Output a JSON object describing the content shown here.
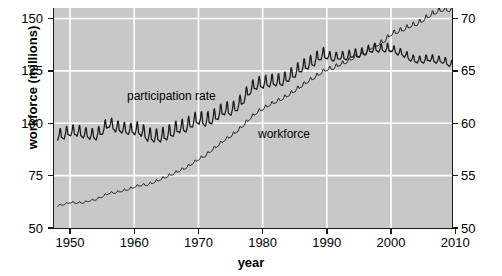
{
  "chart_data": {
    "type": "line",
    "title": "",
    "subtitle": "",
    "xlabel": "year",
    "ylabel": "workforce (millions)",
    "ylabel_right": "participation rate (percent)",
    "xlim": [
      1947.5,
      2009.5
    ],
    "ylim": [
      50,
      155
    ],
    "ylim_right": [
      50,
      71
    ],
    "grid": true,
    "legend_position": "in-plot annotations",
    "xticks": [
      1950,
      1960,
      1970,
      1980,
      1990,
      2000,
      2010
    ],
    "xticklabels": [
      "1950",
      "1960",
      "1970",
      "1980",
      "1990",
      "2000",
      "2010"
    ],
    "yticks": [
      50,
      75,
      100,
      125,
      150
    ],
    "yticklabels": [
      "50",
      "75",
      "100",
      "125",
      "150"
    ],
    "yticks_right": [
      50,
      55,
      60,
      65,
      70
    ],
    "yticklabels_right": [
      "50",
      "55",
      "60",
      "65",
      "70"
    ],
    "annotations": [
      {
        "text": "participation rate",
        "x": 1963.5,
        "y": 113
      },
      {
        "text": "workforce",
        "x": 1984.0,
        "y": 92
      }
    ],
    "series": [
      {
        "name": "workforce",
        "axis": "left",
        "units": "millions",
        "seasonal": true,
        "description": "Monthly civilian labor force, seasonally unadjusted; small sawtooth seasonal cycle peaking each summer, rising steadily throughout.",
        "annual": [
          {
            "year": 1948,
            "value": 60.6
          },
          {
            "year": 1949,
            "value": 61.3
          },
          {
            "year": 1950,
            "value": 62.2
          },
          {
            "year": 1951,
            "value": 62.0
          },
          {
            "year": 1952,
            "value": 62.1
          },
          {
            "year": 1953,
            "value": 63.0
          },
          {
            "year": 1954,
            "value": 63.6
          },
          {
            "year": 1955,
            "value": 65.0
          },
          {
            "year": 1956,
            "value": 66.6
          },
          {
            "year": 1957,
            "value": 66.9
          },
          {
            "year": 1958,
            "value": 67.6
          },
          {
            "year": 1959,
            "value": 68.4
          },
          {
            "year": 1960,
            "value": 69.6
          },
          {
            "year": 1961,
            "value": 70.5
          },
          {
            "year": 1962,
            "value": 70.6
          },
          {
            "year": 1963,
            "value": 71.8
          },
          {
            "year": 1964,
            "value": 73.1
          },
          {
            "year": 1965,
            "value": 74.5
          },
          {
            "year": 1966,
            "value": 75.8
          },
          {
            "year": 1967,
            "value": 77.3
          },
          {
            "year": 1968,
            "value": 78.7
          },
          {
            "year": 1969,
            "value": 80.7
          },
          {
            "year": 1970,
            "value": 82.8
          },
          {
            "year": 1971,
            "value": 84.4
          },
          {
            "year": 1972,
            "value": 87.0
          },
          {
            "year": 1973,
            "value": 89.4
          },
          {
            "year": 1974,
            "value": 91.9
          },
          {
            "year": 1975,
            "value": 93.8
          },
          {
            "year": 1976,
            "value": 96.2
          },
          {
            "year": 1977,
            "value": 99.0
          },
          {
            "year": 1978,
            "value": 102.3
          },
          {
            "year": 1979,
            "value": 105.0
          },
          {
            "year": 1980,
            "value": 106.9
          },
          {
            "year": 1981,
            "value": 108.7
          },
          {
            "year": 1982,
            "value": 110.2
          },
          {
            "year": 1983,
            "value": 111.6
          },
          {
            "year": 1984,
            "value": 113.5
          },
          {
            "year": 1985,
            "value": 115.5
          },
          {
            "year": 1986,
            "value": 117.8
          },
          {
            "year": 1987,
            "value": 119.9
          },
          {
            "year": 1988,
            "value": 121.7
          },
          {
            "year": 1989,
            "value": 123.9
          },
          {
            "year": 1990,
            "value": 125.8
          },
          {
            "year": 1991,
            "value": 126.3
          },
          {
            "year": 1992,
            "value": 128.1
          },
          {
            "year": 1993,
            "value": 129.2
          },
          {
            "year": 1994,
            "value": 131.1
          },
          {
            "year": 1995,
            "value": 132.3
          },
          {
            "year": 1996,
            "value": 133.9
          },
          {
            "year": 1997,
            "value": 136.3
          },
          {
            "year": 1998,
            "value": 137.7
          },
          {
            "year": 1999,
            "value": 139.4
          },
          {
            "year": 2000,
            "value": 142.6
          },
          {
            "year": 2001,
            "value": 143.7
          },
          {
            "year": 2002,
            "value": 144.9
          },
          {
            "year": 2003,
            "value": 146.5
          },
          {
            "year": 2004,
            "value": 147.4
          },
          {
            "year": 2005,
            "value": 149.3
          },
          {
            "year": 2006,
            "value": 151.4
          },
          {
            "year": 2007,
            "value": 153.1
          },
          {
            "year": 2008,
            "value": 154.3
          },
          {
            "year": 2009,
            "value": 154.1
          }
        ]
      },
      {
        "name": "participation rate",
        "axis": "right",
        "units": "percent",
        "seasonal": true,
        "description": "Monthly labor force participation rate, seasonally unadjusted; large sawtooth seasonal swing peaking each summer, rising until about 2000 then declining.",
        "annual": [
          {
            "year": 1948,
            "value": 58.8
          },
          {
            "year": 1949,
            "value": 58.9
          },
          {
            "year": 1950,
            "value": 59.2
          },
          {
            "year": 1951,
            "value": 59.2
          },
          {
            "year": 1952,
            "value": 59.0
          },
          {
            "year": 1953,
            "value": 58.9
          },
          {
            "year": 1954,
            "value": 58.8
          },
          {
            "year": 1955,
            "value": 59.3
          },
          {
            "year": 1956,
            "value": 60.0
          },
          {
            "year": 1957,
            "value": 59.6
          },
          {
            "year": 1958,
            "value": 59.5
          },
          {
            "year": 1959,
            "value": 59.3
          },
          {
            "year": 1960,
            "value": 59.4
          },
          {
            "year": 1961,
            "value": 59.3
          },
          {
            "year": 1962,
            "value": 58.8
          },
          {
            "year": 1963,
            "value": 58.7
          },
          {
            "year": 1964,
            "value": 58.7
          },
          {
            "year": 1965,
            "value": 58.9
          },
          {
            "year": 1966,
            "value": 59.2
          },
          {
            "year": 1967,
            "value": 59.6
          },
          {
            "year": 1968,
            "value": 59.6
          },
          {
            "year": 1969,
            "value": 60.1
          },
          {
            "year": 1970,
            "value": 60.4
          },
          {
            "year": 1971,
            "value": 60.2
          },
          {
            "year": 1972,
            "value": 60.4
          },
          {
            "year": 1973,
            "value": 60.8
          },
          {
            "year": 1974,
            "value": 61.3
          },
          {
            "year": 1975,
            "value": 61.2
          },
          {
            "year": 1976,
            "value": 61.6
          },
          {
            "year": 1977,
            "value": 62.3
          },
          {
            "year": 1978,
            "value": 63.2
          },
          {
            "year": 1979,
            "value": 63.7
          },
          {
            "year": 1980,
            "value": 63.8
          },
          {
            "year": 1981,
            "value": 63.9
          },
          {
            "year": 1982,
            "value": 64.0
          },
          {
            "year": 1983,
            "value": 64.0
          },
          {
            "year": 1984,
            "value": 64.4
          },
          {
            "year": 1985,
            "value": 64.8
          },
          {
            "year": 1986,
            "value": 65.3
          },
          {
            "year": 1987,
            "value": 65.6
          },
          {
            "year": 1988,
            "value": 65.9
          },
          {
            "year": 1989,
            "value": 66.5
          },
          {
            "year": 1990,
            "value": 66.5
          },
          {
            "year": 1991,
            "value": 66.2
          },
          {
            "year": 1992,
            "value": 66.4
          },
          {
            "year": 1993,
            "value": 66.3
          },
          {
            "year": 1994,
            "value": 66.6
          },
          {
            "year": 1995,
            "value": 66.6
          },
          {
            "year": 1996,
            "value": 66.8
          },
          {
            "year": 1997,
            "value": 67.1
          },
          {
            "year": 1998,
            "value": 67.1
          },
          {
            "year": 1999,
            "value": 67.1
          },
          {
            "year": 2000,
            "value": 67.1
          },
          {
            "year": 2001,
            "value": 66.8
          },
          {
            "year": 2002,
            "value": 66.6
          },
          {
            "year": 2003,
            "value": 66.2
          },
          {
            "year": 2004,
            "value": 66.0
          },
          {
            "year": 2005,
            "value": 66.0
          },
          {
            "year": 2006,
            "value": 66.2
          },
          {
            "year": 2007,
            "value": 66.0
          },
          {
            "year": 2008,
            "value": 66.0
          },
          {
            "year": 2009,
            "value": 65.7
          }
        ]
      }
    ],
    "colors": {
      "panel_background": "#c8c8c8",
      "gridline": "#ffffff",
      "line": "#1a1a1a",
      "axis": "#1a1a1a",
      "text": "#000000",
      "figure_background": "#ffffff"
    }
  }
}
